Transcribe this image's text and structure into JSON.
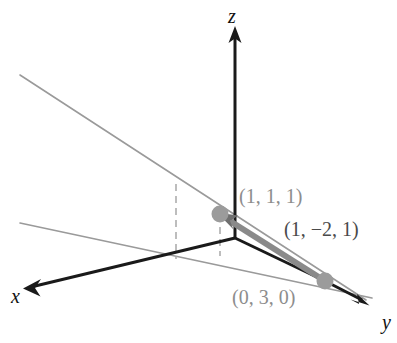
{
  "figure": {
    "background_color": "#ffffff",
    "width": 397,
    "height": 343
  },
  "colors": {
    "axis_black": "#1a1a1a",
    "trace_gray": "#9a9a9a",
    "vector_gray": "#8a8a8a",
    "dot_gray": "#9b9b9b",
    "dashed_gray": "#a8a8a8",
    "label_gray": "#8d8d8d",
    "label_dark": "#4a4a4a"
  },
  "axes": [
    {
      "id": "x",
      "label": "x",
      "label_x": 11,
      "label_y": 286,
      "from": {
        "x": 235,
        "y": 238
      },
      "to": {
        "x": 24,
        "y": 288
      },
      "arrow": "left"
    },
    {
      "id": "y",
      "label": "y",
      "label_x": 382,
      "label_y": 312,
      "from": {
        "x": 235,
        "y": 238
      },
      "to": {
        "x": 368,
        "y": 305
      },
      "arrow": "right-down"
    },
    {
      "id": "z",
      "label": "z",
      "label_x": 228,
      "label_y": 6,
      "from": {
        "x": 235,
        "y": 238
      },
      "to": {
        "x": 235,
        "y": 28
      },
      "arrow": "up"
    }
  ],
  "origin": {
    "x": 235,
    "y": 238
  },
  "points": [
    {
      "id": "p111",
      "label": "(1, 1, 1)",
      "x": 220,
      "y": 214,
      "radius": 8,
      "label_x": 239,
      "label_y": 186
    },
    {
      "id": "p030",
      "label": "(0, 3, 0)",
      "x": 325,
      "y": 281,
      "radius": 8,
      "label_x": 232,
      "label_y": 287
    }
  ],
  "vector": {
    "id": "v1m21",
    "label": "(1, −2, 1)",
    "from": {
      "x": 325,
      "y": 281
    },
    "to": {
      "x": 222,
      "y": 216
    },
    "label_x": 284,
    "label_y": 219,
    "width": 6
  },
  "traces": [
    {
      "id": "upper-plane-trace",
      "from": {
        "x": 20,
        "y": 75
      },
      "to": {
        "x": 366,
        "y": 300
      }
    },
    {
      "id": "lower-plane-trace",
      "from": {
        "x": 20,
        "y": 223
      },
      "to": {
        "x": 372,
        "y": 298
      }
    }
  ],
  "dashed_lines": [
    {
      "id": "dash-left",
      "x": 176,
      "y1": 184,
      "y2": 259
    },
    {
      "id": "dash-right",
      "x": 220,
      "y1": 227,
      "y2": 256
    }
  ],
  "black_segments": [
    {
      "id": "origin-to-p030",
      "from": {
        "x": 235,
        "y": 238
      },
      "to": {
        "x": 325,
        "y": 281
      }
    }
  ]
}
